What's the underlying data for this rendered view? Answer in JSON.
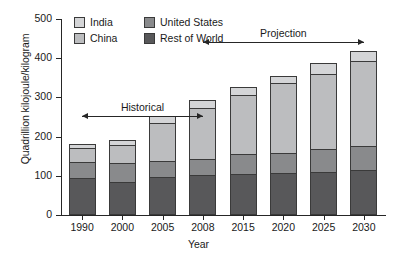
{
  "chart_data": {
    "type": "bar",
    "stacked": true,
    "title": "",
    "xlabel": "Year",
    "ylabel": "Quadrillion kilojoule/kilogram",
    "categories": [
      "1990",
      "2000",
      "2005",
      "2008",
      "2015",
      "2020",
      "2025",
      "2030"
    ],
    "ylim": [
      0,
      500
    ],
    "yticks": [
      0,
      100,
      200,
      300,
      400,
      500
    ],
    "grid": false,
    "legend_position": "top-left-inside",
    "series": [
      {
        "name": "Rest of World",
        "color": "#58585a",
        "values": [
          95,
          85,
          96,
          101,
          105,
          108,
          110,
          115
        ]
      },
      {
        "name": "United States",
        "color": "#898a8c",
        "values": [
          42,
          49,
          45,
          45,
          54,
          54,
          60,
          63
        ]
      },
      {
        "name": "China",
        "color": "#bcbdbf",
        "values": [
          38,
          50,
          99,
          132,
          152,
          179,
          196,
          219
        ]
      },
      {
        "name": "India",
        "color": "#d4d5d7",
        "values": [
          15,
          16,
          20,
          22,
          24,
          21,
          30,
          30
        ]
      }
    ],
    "totals": [
      190,
      200,
      260,
      300,
      335,
      362,
      396,
      427
    ],
    "annotations": [
      {
        "label": "Historical",
        "from": "1990",
        "to": "2008",
        "style": "double-arrow"
      },
      {
        "label": "Projection",
        "from": "2008",
        "to": "2030",
        "style": "double-arrow"
      }
    ]
  },
  "legend": {
    "items": [
      {
        "label": "India"
      },
      {
        "label": "United States"
      },
      {
        "label": "China"
      },
      {
        "label": "Rest of World"
      }
    ]
  }
}
